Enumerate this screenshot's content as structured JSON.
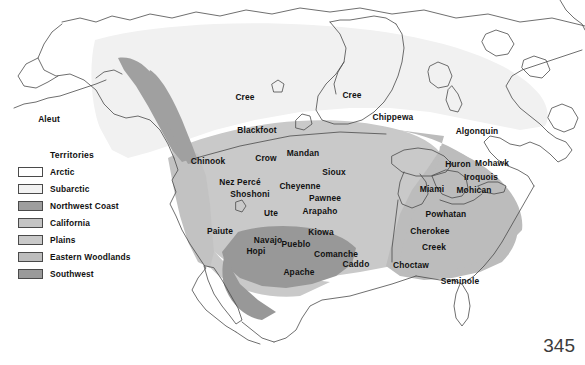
{
  "page": {
    "caption_text": "sharing a language and customs.",
    "page_number": "345"
  },
  "legend": {
    "title": "Territories",
    "items": [
      {
        "label": "Arctic",
        "color": "#ffffff"
      },
      {
        "label": "Subarctic",
        "color": "#f2f2f2"
      },
      {
        "label": "Northwest Coast",
        "color": "#9e9e9e"
      },
      {
        "label": "California",
        "color": "#c4c4c4"
      },
      {
        "label": "Plains",
        "color": "#c9c9c9"
      },
      {
        "label": "Eastern Woodlands",
        "color": "#bdbdbd"
      },
      {
        "label": "Southwest",
        "color": "#9a9a9a"
      }
    ]
  },
  "map": {
    "colors": {
      "arctic": "#ffffff",
      "subarctic": "#f1f1f1",
      "northwest_coast": "#a0a0a0",
      "california": "#c2c2c2",
      "plains": "#c9c9c9",
      "eastern_woodlands": "#bcbcbc",
      "southwest": "#989898",
      "outline": "#4a4a4a",
      "water": "#ffffff"
    },
    "labels": [
      {
        "name": "Aleut",
        "x": 49,
        "y": 119
      },
      {
        "name": "Cree",
        "x": 245,
        "y": 97
      },
      {
        "name": "Cree",
        "x": 352,
        "y": 95
      },
      {
        "name": "Chippewa",
        "x": 393,
        "y": 117
      },
      {
        "name": "Algonquin",
        "x": 477,
        "y": 131
      },
      {
        "name": "Blackfoot",
        "x": 257,
        "y": 130
      },
      {
        "name": "Chinook",
        "x": 208,
        "y": 161
      },
      {
        "name": "Crow",
        "x": 266,
        "y": 158
      },
      {
        "name": "Mandan",
        "x": 303,
        "y": 153
      },
      {
        "name": "Sioux",
        "x": 334,
        "y": 172
      },
      {
        "name": "Huron",
        "x": 458,
        "y": 164
      },
      {
        "name": "Mohawk",
        "x": 492,
        "y": 163
      },
      {
        "name": "Iroquois",
        "x": 481,
        "y": 177
      },
      {
        "name": "Nez Percé",
        "x": 240,
        "y": 182
      },
      {
        "name": "Cheyenne",
        "x": 300,
        "y": 186
      },
      {
        "name": "Miami",
        "x": 432,
        "y": 189
      },
      {
        "name": "Mohican",
        "x": 474,
        "y": 190
      },
      {
        "name": "Shoshoni",
        "x": 250,
        "y": 194
      },
      {
        "name": "Pawnee",
        "x": 325,
        "y": 198
      },
      {
        "name": "Ute",
        "x": 271,
        "y": 213
      },
      {
        "name": "Arapaho",
        "x": 320,
        "y": 211
      },
      {
        "name": "Powhatan",
        "x": 446,
        "y": 214
      },
      {
        "name": "Paiute",
        "x": 220,
        "y": 231
      },
      {
        "name": "Kiowa",
        "x": 321,
        "y": 232
      },
      {
        "name": "Cherokee",
        "x": 430,
        "y": 231
      },
      {
        "name": "Navajo",
        "x": 268,
        "y": 240
      },
      {
        "name": "Pueblo",
        "x": 296,
        "y": 244
      },
      {
        "name": "Creek",
        "x": 434,
        "y": 247
      },
      {
        "name": "Hopi",
        "x": 256,
        "y": 251
      },
      {
        "name": "Comanche",
        "x": 336,
        "y": 254
      },
      {
        "name": "Caddo",
        "x": 356,
        "y": 264
      },
      {
        "name": "Choctaw",
        "x": 411,
        "y": 265
      },
      {
        "name": "Apache",
        "x": 299,
        "y": 272
      },
      {
        "name": "Seminole",
        "x": 460,
        "y": 281
      }
    ]
  }
}
